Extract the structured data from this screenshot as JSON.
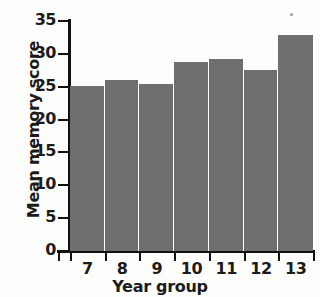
{
  "chart_data": {
    "type": "bar",
    "title": "",
    "xlabel": "Year group",
    "ylabel": "Mean memory score",
    "categories": [
      "7",
      "8",
      "9",
      "10",
      "11",
      "12",
      "13"
    ],
    "values": [
      25.1,
      26.1,
      25.4,
      28.8,
      29.2,
      27.5,
      32.9
    ],
    "ylim": [
      0,
      35
    ],
    "ytick_labels": [
      "0",
      "5",
      "10",
      "15",
      "20",
      "25",
      "30",
      "35"
    ],
    "ytick_values": [
      0,
      5,
      10,
      15,
      20,
      25,
      30,
      35
    ],
    "grid": false,
    "legend": null,
    "bar_color": "#6f6f6f",
    "axis_color": "#111111",
    "background": "#fdfdfc"
  }
}
